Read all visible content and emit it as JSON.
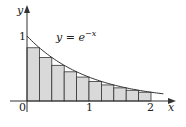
{
  "chart_data": {
    "type": "area",
    "title": "",
    "function_label": {
      "base": "y = e",
      "exponent": "−x"
    },
    "xlabel": "x",
    "ylabel": "y",
    "x_ticks": [
      "0",
      "1",
      "2"
    ],
    "y_ticks": [
      "1"
    ],
    "xlim": [
      0,
      2.3
    ],
    "ylim": [
      0,
      1.45
    ],
    "rectangles": {
      "count": 10,
      "width": 0.2,
      "rule": "right-endpoint",
      "x_left": [
        0,
        0.2,
        0.4,
        0.6,
        0.8,
        1.0,
        1.2,
        1.4,
        1.6,
        1.8
      ],
      "heights": [
        0.819,
        0.67,
        0.549,
        0.449,
        0.368,
        0.301,
        0.247,
        0.202,
        0.165,
        0.135
      ]
    },
    "curve": {
      "function": "exp(-x)",
      "x_range": [
        0,
        2.2
      ]
    },
    "grid": false
  },
  "colors": {
    "fill": "#d9d9d9",
    "stroke": "#333333",
    "axis": "#333333"
  }
}
